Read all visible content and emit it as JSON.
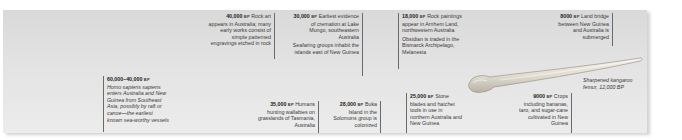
{
  "timeline": {
    "events": [
      {
        "date": "60,000–40,000",
        "era": "BP",
        "text": "Homo sapiens sapiens enters Australia and New Guinea from Southeast Asia, possibly by raft or canoe—the earliest known sea-worthy vessels",
        "extra": ""
      },
      {
        "date": "40,000",
        "era": "BP",
        "text": "Rock art appears in Australia; many early works consist of simple patterned engravings etched in rock",
        "extra": ""
      },
      {
        "date": "35,000",
        "era": "BP",
        "text": "Humans hunting wallabies on grasslands of Tasmania, Australia",
        "extra": ""
      },
      {
        "date": "30,000",
        "era": "BP",
        "text": "Earliest evidence of cremation at Lake Mungo, southeastern Australia",
        "extra": "Seafaring groups inhabit the islands east of New Guinea"
      },
      {
        "date": "28,000",
        "era": "BP",
        "text": "Buka Island in the Solomons group is colonized",
        "extra": ""
      },
      {
        "date": "25,000",
        "era": "BP",
        "text": "Stone blades and hatchet tools in use in northern Australia and New Guinea",
        "extra": ""
      },
      {
        "date": "18,000",
        "era": "BP",
        "text": "Rock paintings appear in Arnhem Land, northwestern Australia",
        "extra": "Obsidian is traded in the Bismarck Archipelago, Melanesia"
      },
      {
        "date": "9000",
        "era": "BP",
        "text": "Crops including bananas, taro, and sugar-cane cultivated in New Guinea",
        "extra": ""
      },
      {
        "date": "8000",
        "era": "BP",
        "text": "Land bridge between New Guinea and Australia is submerged",
        "extra": ""
      }
    ],
    "image_caption": {
      "line1": "Sharpened kangaroo",
      "line2": "femur, 12,000 BP"
    }
  }
}
